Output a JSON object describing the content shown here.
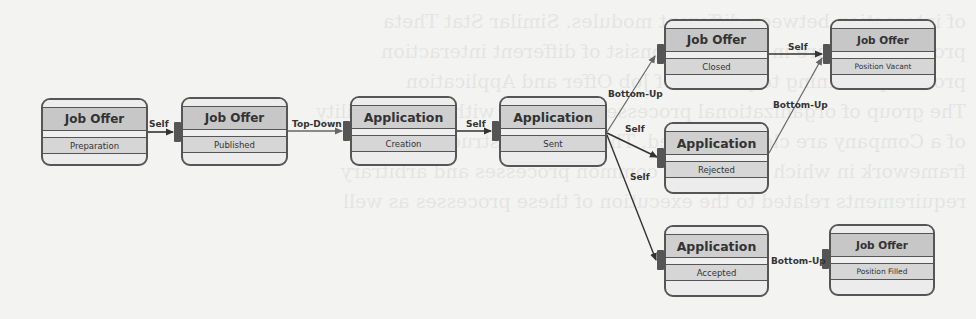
{
  "diagram": {
    "nodes": [
      {
        "id": "n1",
        "entity": "Job Offer",
        "state": "Preparation"
      },
      {
        "id": "n2",
        "entity": "Job Offer",
        "state": "Published"
      },
      {
        "id": "n3",
        "entity": "Application",
        "state": "Creation"
      },
      {
        "id": "n4",
        "entity": "Application",
        "state": "Sent"
      },
      {
        "id": "n5",
        "entity": "Job Offer",
        "state": "Closed"
      },
      {
        "id": "n6",
        "entity": "Job Offer",
        "state": "Position Vacant"
      },
      {
        "id": "n7",
        "entity": "Application",
        "state": "Rejected"
      },
      {
        "id": "n8",
        "entity": "Application",
        "state": "Accepted"
      },
      {
        "id": "n9",
        "entity": "Job Offer",
        "state": "Position Filled"
      }
    ],
    "edges": [
      {
        "from": "n1",
        "to": "n2",
        "label": "Self"
      },
      {
        "from": "n2",
        "to": "n3",
        "label": "Top-Down"
      },
      {
        "from": "n3",
        "to": "n4",
        "label": "Self"
      },
      {
        "from": "n4",
        "to": "n5",
        "label": "Bottom-Up"
      },
      {
        "from": "n4",
        "to": "n7",
        "label": "Self"
      },
      {
        "from": "n4",
        "to": "n8",
        "label": "Self"
      },
      {
        "from": "n5",
        "to": "n6",
        "label": "Self"
      },
      {
        "from": "n7",
        "to": "n6",
        "label": "Bottom-Up"
      },
      {
        "from": "n8",
        "to": "n9",
        "label": "Bottom-Up"
      }
    ]
  },
  "background_showthrough": "of interaction between different modules. Similar Stat Theta\nprocess structure in Figure is consist of different interaction\nprocess pertaining to process of Job Offer and Application\nThe group of organizational processes notations with responsibility\nof a Company are clearly defined. This provides structural\nframework in which to perform common processes and arbitrary\nrequirements related to the execution of these processes as well"
}
